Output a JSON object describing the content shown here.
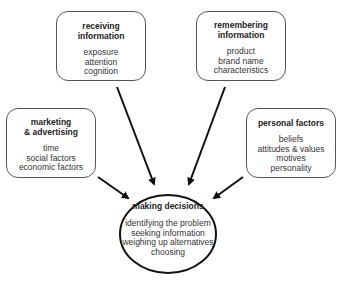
{
  "diagram": {
    "nodes": {
      "receiving": {
        "title": "receiving\ninformation",
        "title_lines": [
          "receiving",
          "information"
        ],
        "items": [
          "exposure",
          "attention",
          "cognition"
        ]
      },
      "remembering": {
        "title_lines": [
          "remembering",
          "information"
        ],
        "items": [
          "product",
          "brand name",
          "characteristics"
        ]
      },
      "marketing": {
        "title_lines": [
          "marketing",
          "& advertising"
        ],
        "items": [
          "time",
          "social factors",
          "economic factors"
        ]
      },
      "personal": {
        "title_lines": [
          "personal factors"
        ],
        "items": [
          "beliefs",
          "attitudes & values",
          "motives",
          "personality"
        ]
      },
      "decisions": {
        "title_lines": [
          "making decisions"
        ],
        "items": [
          "identifying the problem",
          "seeking information",
          "weighing up alternatives",
          "choosing"
        ]
      }
    },
    "edges": [
      {
        "from": "receiving",
        "to": "decisions"
      },
      {
        "from": "remembering",
        "to": "decisions"
      },
      {
        "from": "marketing",
        "to": "decisions"
      },
      {
        "from": "personal",
        "to": "decisions"
      }
    ],
    "colors": {
      "box_border": "#555555",
      "arrow": "#111111",
      "text": "#222222",
      "background": "#ffffff"
    }
  }
}
